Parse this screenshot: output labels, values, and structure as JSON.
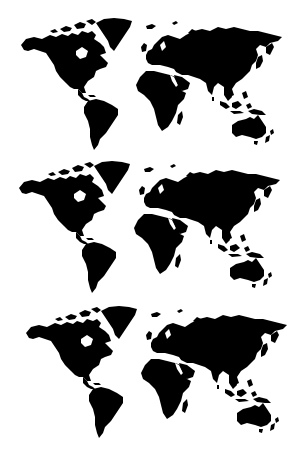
{
  "caption": {
    "text": "· · · · · · · · · · ·",
    "note_visible": "cropped"
  },
  "maps": [
    {
      "label": "world-map",
      "fill": "#000000",
      "left": 20,
      "top": 17,
      "width": 264,
      "height": 134
    },
    {
      "label": "world-map",
      "fill": "#000000",
      "left": 18,
      "top": 160,
      "width": 264,
      "height": 134
    },
    {
      "label": "world-map",
      "fill": "#000000",
      "left": 25,
      "top": 305,
      "width": 264,
      "height": 134
    }
  ],
  "colors": {
    "background": "#ffffff",
    "land": "#000000"
  }
}
